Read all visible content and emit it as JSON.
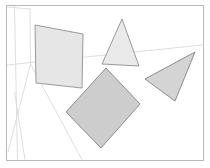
{
  "canvas": {
    "width": 210,
    "height": 168,
    "background_color": "#ffffff",
    "title": "Perspective room with floating polygons"
  },
  "frame": {
    "label": "Image border frame",
    "x": 6.5,
    "y": 5.5,
    "width": 197,
    "height": 155,
    "stroke_color": "#b9b9b9",
    "stroke_width": 1,
    "fill_color": "#ffffff"
  },
  "background": {
    "label": "Room interior perspective guide lines",
    "stroke_color": "#dadada",
    "stroke_width": 0.9,
    "lines": [
      {
        "name": "left-wall-vertical-edge",
        "x1": 14.5,
        "y1": 6.5,
        "x2": 17.5,
        "y2": 159.5
      },
      {
        "name": "back-corner-vertical-edge",
        "x1": 30.0,
        "y1": 9.0,
        "x2": 30.5,
        "y2": 64.0
      },
      {
        "name": "wall-floor-horizon-line",
        "x1": 7.0,
        "y1": 65.0,
        "x2": 203.0,
        "y2": 45.0
      },
      {
        "name": "floor-receding-line-left",
        "x1": 30.5,
        "y1": 64.0,
        "x2": 8.0,
        "y2": 152.0
      },
      {
        "name": "floor-receding-line-center",
        "x1": 30.5,
        "y1": 64.0,
        "x2": 82.0,
        "y2": 159.5
      },
      {
        "name": "left-wall-lower-diagonal",
        "x1": 14.5,
        "y1": 92.0,
        "x2": 25.0,
        "y2": 159.5
      },
      {
        "name": "ceiling-receding-line",
        "x1": 30.0,
        "y1": 9.0,
        "x2": 7.0,
        "y2": 7.0
      }
    ]
  },
  "shapes": [
    {
      "id": "shape-1",
      "name": "left-quadrilateral",
      "type": "quadrilateral",
      "label": "Light gray tilted square panel, upper left",
      "fill_color": "#e6e6e6",
      "stroke_color": "#9a9a9a",
      "stroke_width": 1,
      "points": "35,25 83,34 82,88 36,83"
    },
    {
      "id": "shape-2",
      "name": "upper-triangle",
      "type": "triangle",
      "label": "Light gray triangle, upper center",
      "fill_color": "#eaeaea",
      "stroke_color": "#9a9a9a",
      "stroke_width": 1,
      "points": "122,19 102,64 139,66"
    },
    {
      "id": "shape-3",
      "name": "right-triangle",
      "type": "triangle",
      "label": "Medium gray triangle, right side",
      "fill_color": "#d4d4d4",
      "stroke_color": "#8d8d8d",
      "stroke_width": 1,
      "points": "195,52 145,79 175,101"
    },
    {
      "id": "shape-4",
      "name": "center-rectangle",
      "type": "quadrilateral",
      "label": "Medium gray rotated rectangle, center",
      "fill_color": "#cdcdcd",
      "stroke_color": "#8d8d8d",
      "stroke_width": 1,
      "points": "106,68 140,104 101,148 66,112"
    }
  ],
  "chart_data": {
    "type": "scatter",
    "title": "Perspective room with floating polygons",
    "xlabel": "",
    "ylabel": "",
    "xlim": [
      0,
      210
    ],
    "ylim": [
      0,
      168
    ],
    "grid": false,
    "legend": "none",
    "annotations": [
      "left-quadrilateral",
      "upper-triangle",
      "right-triangle",
      "center-rectangle"
    ]
  }
}
